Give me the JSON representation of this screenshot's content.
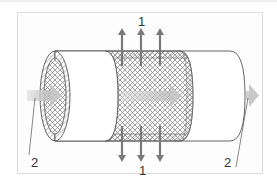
{
  "diagram": {
    "title": "",
    "labels": {
      "permeate_top": "1",
      "permeate_bottom": "1",
      "flow_in": "2",
      "flow_out": "2"
    },
    "legend_meaning": {
      "1": "radial permeate flow arrows (through mesh membrane)",
      "2": "axial feed flow arrows (in and out of tube)"
    },
    "colors": {
      "outline": "#555555",
      "mesh": "#777777",
      "arrow_dark": "#7a7a7a",
      "arrow_light": "#c8c8c8",
      "frame_border": "#dcdcdc",
      "background": "#ffffff"
    },
    "components": [
      {
        "id": "tube-body",
        "description": "cylinder tube, white outer shell"
      },
      {
        "id": "inlet-face",
        "description": "left end cross-section with hatched wall and mesh core"
      },
      {
        "id": "mesh-section",
        "description": "cut-away middle section showing cross-hatched mesh"
      },
      {
        "id": "permeate-arrows-up",
        "count": 3
      },
      {
        "id": "permeate-arrows-down",
        "count": 3
      },
      {
        "id": "feed-arrow-in",
        "count": 1
      },
      {
        "id": "inner-flow-arrow",
        "count": 1
      },
      {
        "id": "feed-arrow-out",
        "count": 1
      }
    ]
  }
}
